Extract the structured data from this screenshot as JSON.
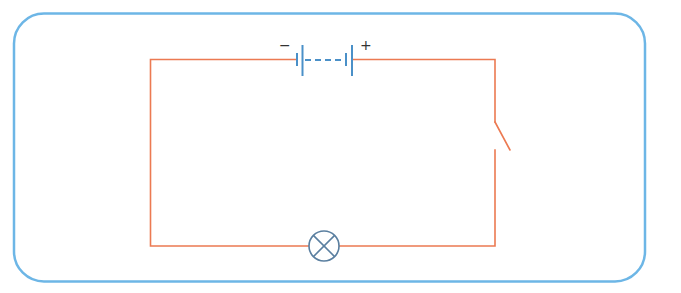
{
  "diagram": {
    "colors": {
      "frame": "#6db6e6",
      "wire": "#ec7a52",
      "battery": "#4a90c8",
      "lamp": "#5a7fa0",
      "label": "#333333"
    },
    "battery": {
      "negative_label": "−",
      "positive_label": "+",
      "cells": 2
    },
    "switch": {
      "state": "open"
    },
    "lamp": {
      "symbol": "circle-with-x"
    }
  }
}
